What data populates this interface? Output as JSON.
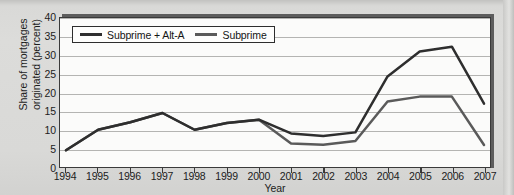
{
  "chart_data": {
    "type": "line",
    "title": "",
    "xlabel": "Year",
    "ylabel": "Share of mortgages originated (percent)",
    "ylabel_line1": "Share of mortgages",
    "ylabel_line2": "originated (percent)",
    "x": [
      1994,
      1995,
      1996,
      1997,
      1998,
      1999,
      2000,
      2001,
      2002,
      2003,
      2004,
      2005,
      2006,
      2007
    ],
    "categories": [
      "1994",
      "1995",
      "1996",
      "1997",
      "1998",
      "1999",
      "2000",
      "2001",
      "2002",
      "2003",
      "2004",
      "2005",
      "2006",
      "2007"
    ],
    "ylim": [
      0,
      40
    ],
    "yticks": [
      0,
      5,
      10,
      15,
      20,
      25,
      30,
      35,
      40
    ],
    "ytick_labels": [
      "0",
      "5",
      "10",
      "15",
      "20",
      "25",
      "30",
      "35",
      "40"
    ],
    "grid": "horizontal",
    "legend_position": "top-left",
    "series": [
      {
        "name": "Subprime + Alt-A",
        "color": "#2e2e2e",
        "values": [
          4.5,
          10.0,
          12.0,
          14.5,
          10.0,
          11.8,
          12.7,
          9.0,
          8.3,
          9.3,
          24.3,
          31.0,
          32.3,
          17.0
        ]
      },
      {
        "name": "Subprime",
        "color": "#5a5a5a",
        "values": [
          4.5,
          10.0,
          12.0,
          14.5,
          10.0,
          11.8,
          12.7,
          6.3,
          6.0,
          7.0,
          17.6,
          18.9,
          18.9,
          5.9
        ]
      }
    ]
  },
  "legend": {
    "entries": [
      {
        "label": "Subprime + Alt-A",
        "color": "#2e2e2e"
      },
      {
        "label": "Subprime",
        "color": "#5a5a5a"
      }
    ]
  },
  "axes": {
    "x_title": "Year",
    "y_title_line1": "Share of mortgages",
    "y_title_line2": "originated (percent)"
  },
  "colors": {
    "paper_background": "#d9d9d7",
    "plot_background": "#fbfbfa",
    "frame": "#3a3a3a",
    "shadow": "#5d5d5d",
    "gridline": "#b4b4b2",
    "series_primary": "#2e2e2e",
    "series_secondary": "#5a5a5a"
  }
}
